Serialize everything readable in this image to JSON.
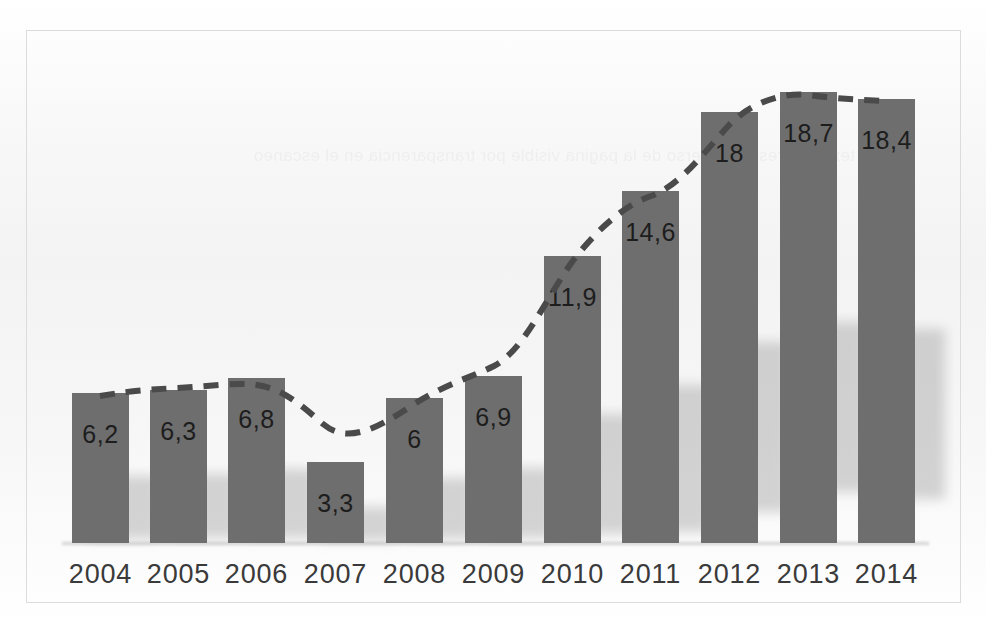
{
  "figure": {
    "frame": {
      "x": 26,
      "y": 30,
      "width": 935,
      "height": 573
    },
    "baseline_y": 543,
    "bar_color": "#6e6e6e",
    "trend_color": "#4a4a4a",
    "label_color": "#1d1d1d",
    "year_color": "#3a3a3a",
    "frame_color": "#dcdcdc",
    "background_color": "#ffffff",
    "showthrough_text": "texto impreso al reverso de la pagina visible por transparencia en el escaneo"
  },
  "chart_data": {
    "type": "bar",
    "title": "",
    "subtitle": "",
    "xlabel": "",
    "ylabel": "",
    "grid": false,
    "legend": "none",
    "ylim": [
      0,
      19.5
    ],
    "categories": [
      "2004",
      "2005",
      "2006",
      "2007",
      "2008",
      "2009",
      "2010",
      "2011",
      "2012",
      "2013",
      "2014"
    ],
    "values": [
      6.2,
      6.3,
      6.8,
      3.3,
      6.0,
      6.9,
      11.9,
      14.6,
      18.0,
      18.7,
      18.4
    ],
    "value_labels": [
      "6,2",
      "6,3",
      "6,8",
      "3,3",
      "6",
      "6,9",
      "11,9",
      "14,6",
      "18",
      "18,7",
      "18,4"
    ],
    "tick_labels": [
      "2004",
      "2005",
      "2006",
      "2007",
      "2008",
      "2009",
      "2010",
      "2011",
      "2012",
      "2013",
      "2014"
    ],
    "series": [
      {
        "name": "bars",
        "type": "bar",
        "values": [
          6.2,
          6.3,
          6.8,
          3.3,
          6.0,
          6.9,
          11.9,
          14.6,
          18.0,
          18.7,
          18.4
        ]
      },
      {
        "name": "trend",
        "type": "line",
        "style": "dashed",
        "values": [
          6.2,
          6.3,
          6.8,
          3.3,
          6.0,
          6.9,
          11.9,
          14.6,
          18.0,
          18.7,
          18.4
        ]
      }
    ],
    "annotations": [
      "Dashed trend line follows the tops of the bars, smoothed through 2007"
    ]
  },
  "bars": [
    {
      "year": "2004",
      "label": "6,2",
      "value": 6.2,
      "x": 72,
      "width": 57,
      "top": 393
    },
    {
      "year": "2005",
      "label": "6,3",
      "value": 6.3,
      "x": 150,
      "width": 57,
      "top": 390
    },
    {
      "year": "2006",
      "label": "6,8",
      "value": 6.8,
      "x": 228,
      "width": 57,
      "top": 378
    },
    {
      "year": "2007",
      "label": "3,3",
      "value": 3.3,
      "x": 307,
      "width": 57,
      "top": 462
    },
    {
      "year": "2008",
      "label": "6",
      "value": 6.0,
      "x": 386,
      "width": 57,
      "top": 398
    },
    {
      "year": "2009",
      "label": "6,9",
      "value": 6.9,
      "x": 465,
      "width": 57,
      "top": 376
    },
    {
      "year": "2010",
      "label": "11,9",
      "value": 11.9,
      "x": 544,
      "width": 57,
      "top": 256
    },
    {
      "year": "2011",
      "label": "14,6",
      "value": 14.6,
      "x": 622,
      "width": 57,
      "top": 191
    },
    {
      "year": "2012",
      "label": "18",
      "value": 18.0,
      "x": 701,
      "width": 57,
      "top": 112
    },
    {
      "year": "2013",
      "label": "18,7",
      "value": 18.7,
      "x": 780,
      "width": 57,
      "top": 92
    },
    {
      "year": "2014",
      "label": "18,4",
      "value": 18.4,
      "x": 858,
      "width": 57,
      "top": 99
    }
  ],
  "trend_path": "M 100,396 C 124,392 138,390 178,388 C 214,386 238,382 257,385 C 283,389 300,404 323,424 C 345,442 370,434 414,404 C 450,382 470,378 494,366 C 524,350 545,300 572,262 C 598,228 625,205 651,196 C 680,186 706,150 730,124 C 752,102 784,92 808,95 C 838,99 864,100 886,101"
}
